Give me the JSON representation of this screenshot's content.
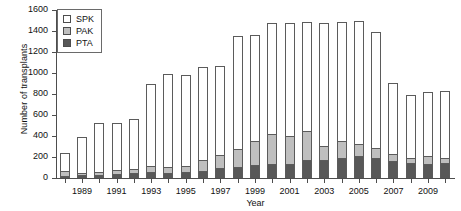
{
  "chart_data": {
    "type": "bar",
    "title": "",
    "subtitle": "",
    "xlabel": "Year",
    "ylabel": "Number of transplants",
    "stacked": true,
    "grid": false,
    "legend_position": "top-left",
    "ylim": [
      0,
      1600
    ],
    "ytick_values": [
      0,
      200,
      400,
      600,
      800,
      1000,
      1200,
      1400,
      1600
    ],
    "ytick_labels": [
      "0",
      "200",
      "400",
      "600",
      "800",
      "1000",
      "1200",
      "1400",
      "1600"
    ],
    "categories": [
      "1988",
      "1989",
      "1990",
      "1991",
      "1992",
      "1993",
      "1994",
      "1995",
      "1996",
      "1997",
      "1998",
      "1999",
      "2000",
      "2001",
      "2002",
      "2003",
      "2004",
      "2005",
      "2006",
      "2007",
      "2008",
      "2009",
      "2010"
    ],
    "xtick_labels": [
      "1989",
      "1991",
      "1993",
      "1995",
      "1997",
      "1999",
      "2001",
      "2003",
      "2005",
      "2007",
      "2009"
    ],
    "series": [
      {
        "name": "PTA",
        "color": "#585858",
        "values": [
          20,
          25,
          30,
          40,
          45,
          55,
          50,
          55,
          65,
          95,
          105,
          120,
          130,
          135,
          170,
          175,
          190,
          205,
          190,
          160,
          140,
          130,
          140
        ]
      },
      {
        "name": "PAK",
        "color": "#bfbfbf",
        "values": [
          45,
          20,
          25,
          40,
          40,
          55,
          55,
          60,
          105,
          125,
          170,
          230,
          290,
          265,
          280,
          130,
          160,
          115,
          95,
          70,
          55,
          75,
          55
        ]
      },
      {
        "name": "SPK",
        "color": "#ffffff",
        "values": [
          170,
          350,
          465,
          445,
          475,
          785,
          890,
          870,
          885,
          845,
          1080,
          1010,
          1060,
          1080,
          1035,
          1170,
          1140,
          1175,
          1110,
          675,
          600,
          615,
          635
        ]
      }
    ],
    "totals": [
      235,
      395,
      520,
      525,
      560,
      895,
      995,
      985,
      1055,
      1065,
      1355,
      1360,
      1480,
      1480,
      1485,
      1475,
      1490,
      1495,
      1395,
      905,
      795,
      820,
      830
    ]
  },
  "legend": {
    "items": [
      {
        "label": "SPK",
        "color": "#ffffff"
      },
      {
        "label": "PAK",
        "color": "#bfbfbf"
      },
      {
        "label": "PTA",
        "color": "#585858"
      }
    ]
  }
}
